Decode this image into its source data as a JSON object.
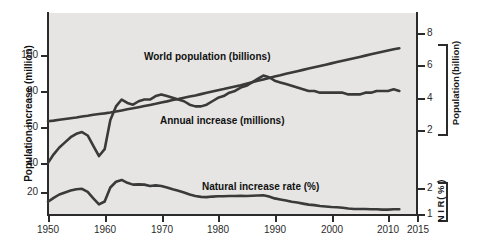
{
  "chart_data": {
    "type": "line",
    "title": "",
    "xlabel": "",
    "ylabel": "Population increase (million)",
    "xlim": [
      1950,
      2015
    ],
    "grid": false,
    "legend_position": "inline-annotations",
    "axes": {
      "left": {
        "label": "Population increase (million)",
        "ticks": [
          20,
          40,
          60,
          80,
          100
        ],
        "tick_labels": [
          "20",
          "40",
          "60",
          "80",
          "100"
        ],
        "range": [
          0,
          112
        ]
      },
      "right_upper": {
        "label_lines": [
          "Population",
          "(billion)"
        ],
        "label": "Population (billion)",
        "ticks": [
          2,
          4,
          6,
          8
        ],
        "tick_labels": [
          "2",
          "4",
          "6",
          "8"
        ]
      },
      "right_lower": {
        "label_lines": [
          "N I R",
          "( % )"
        ],
        "label": "N I R (%)",
        "ticks": [
          1,
          2
        ],
        "tick_labels": [
          "1",
          "2"
        ]
      },
      "bottom": {
        "ticks": [
          1950,
          1960,
          1970,
          1980,
          1990,
          2000,
          2010,
          2015
        ],
        "tick_labels": [
          "1950",
          "1960",
          "1970",
          "1980",
          "1990",
          "2000",
          "2010",
          "2015"
        ]
      }
    },
    "annotations": [
      {
        "name": "world-population-label",
        "text": "World population (billions)"
      },
      {
        "name": "annual-increase-label",
        "text": "Annual increase (millions)"
      },
      {
        "name": "natural-increase-rate-label",
        "text": "Natural increase rate (%)"
      }
    ],
    "x": [
      1950,
      1951,
      1952,
      1953,
      1954,
      1955,
      1956,
      1957,
      1958,
      1959,
      1960,
      1961,
      1962,
      1963,
      1964,
      1965,
      1966,
      1967,
      1968,
      1969,
      1970,
      1971,
      1972,
      1973,
      1974,
      1975,
      1976,
      1977,
      1978,
      1979,
      1980,
      1981,
      1982,
      1983,
      1984,
      1985,
      1986,
      1987,
      1988,
      1989,
      1990,
      1991,
      1992,
      1993,
      1994,
      1995,
      1996,
      1997,
      1998,
      1999,
      2000,
      2001,
      2002,
      2003,
      2004,
      2005,
      2006,
      2007,
      2008,
      2009,
      2010,
      2011,
      2012
    ],
    "series": [
      {
        "name": "World population (billions)",
        "unit": "billions",
        "axis": "right_upper",
        "values": [
          2.54,
          2.58,
          2.63,
          2.68,
          2.73,
          2.77,
          2.83,
          2.88,
          2.94,
          2.99,
          3.03,
          3.08,
          3.14,
          3.21,
          3.28,
          3.34,
          3.41,
          3.48,
          3.55,
          3.62,
          3.7,
          3.77,
          3.85,
          3.92,
          4.0,
          4.07,
          4.14,
          4.22,
          4.3,
          4.38,
          4.46,
          4.53,
          4.61,
          4.69,
          4.77,
          4.86,
          4.95,
          5.04,
          5.13,
          5.22,
          5.31,
          5.39,
          5.48,
          5.56,
          5.64,
          5.72,
          5.8,
          5.88,
          5.96,
          6.04,
          6.12,
          6.2,
          6.28,
          6.36,
          6.44,
          6.52,
          6.6,
          6.68,
          6.76,
          6.84,
          6.92,
          7.0,
          7.06
        ]
      },
      {
        "name": "Annual increase (millions)",
        "unit": "millions",
        "axis": "left",
        "values": [
          37,
          42,
          46,
          49,
          52,
          54,
          55,
          53,
          47,
          41,
          45,
          62,
          70,
          74,
          72,
          71,
          73,
          74,
          74,
          76,
          77,
          76,
          75,
          74,
          73,
          71,
          70,
          70,
          71,
          73,
          75,
          76,
          78,
          79,
          81,
          82,
          84,
          86,
          88,
          87,
          85,
          84,
          83,
          82,
          81,
          80,
          79,
          79,
          78,
          78,
          78,
          78,
          78,
          77,
          77,
          77,
          78,
          78,
          79,
          79,
          79,
          80,
          79
        ]
      },
      {
        "name": "Natural increase rate (%)",
        "unit": "%",
        "axis": "right_lower",
        "values": [
          1.47,
          1.62,
          1.75,
          1.83,
          1.9,
          1.95,
          1.97,
          1.85,
          1.6,
          1.37,
          1.48,
          2.02,
          2.24,
          2.31,
          2.2,
          2.13,
          2.14,
          2.13,
          2.08,
          2.1,
          2.08,
          2.02,
          1.95,
          1.89,
          1.83,
          1.75,
          1.69,
          1.66,
          1.65,
          1.67,
          1.68,
          1.68,
          1.69,
          1.69,
          1.7,
          1.69,
          1.7,
          1.71,
          1.72,
          1.67,
          1.6,
          1.56,
          1.52,
          1.47,
          1.44,
          1.4,
          1.36,
          1.34,
          1.31,
          1.29,
          1.27,
          1.26,
          1.24,
          1.21,
          1.19,
          1.19,
          1.19,
          1.18,
          1.18,
          1.17,
          1.17,
          1.18,
          1.18
        ]
      }
    ]
  }
}
